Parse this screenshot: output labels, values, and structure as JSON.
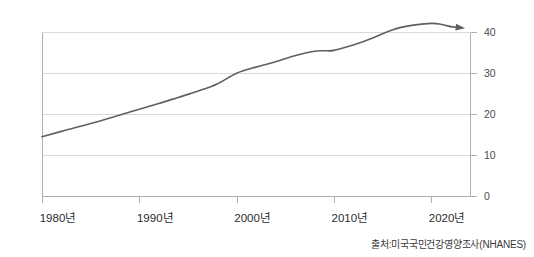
{
  "chart_data": {
    "type": "line",
    "title": "",
    "subtitle": "",
    "xlabel": "",
    "ylabel": "",
    "xlim": [
      1980,
      2024
    ],
    "ylim": [
      0,
      44
    ],
    "grid": true,
    "legend": false,
    "legend_position": "none",
    "x_tick_labels": [
      "1980년",
      "1990년",
      "2000년",
      "2010년",
      "2020년"
    ],
    "x_tick_values": [
      1980,
      1990,
      2000,
      2010,
      2020
    ],
    "y_tick_labels": [
      "0",
      "10",
      "20",
      "30",
      "40"
    ],
    "y_tick_values": [
      0,
      10,
      20,
      30,
      40
    ],
    "series": [
      {
        "name": "",
        "x": [
          1980,
          1982,
          1985,
          1988,
          1990,
          1992,
          1994,
          1996,
          1998,
          2000,
          2002,
          2004,
          2006,
          2008,
          2009,
          2010,
          2012,
          2014,
          2016,
          2018,
          2020,
          2021,
          2022
        ],
        "values": [
          14.5,
          15.8,
          17.7,
          19.8,
          21.2,
          22.6,
          24.1,
          25.6,
          27.4,
          30.0,
          31.5,
          32.8,
          34.3,
          35.4,
          35.5,
          35.6,
          36.9,
          38.6,
          40.6,
          41.7,
          42.2,
          42.0,
          41.4
        ]
      }
    ],
    "annotations": [
      {
        "type": "arrow",
        "name": "trend-arrow-end",
        "x": 2023.5,
        "y": 41.0,
        "direction": "right-down"
      }
    ]
  },
  "source": {
    "label": "출처:미국국민건강영양조사(NHANES)"
  },
  "colors": {
    "line": "#606060",
    "grid": "#d9d9d9",
    "axis": "#b0b0b0",
    "text": "#2b2b2b",
    "background": "#ffffff"
  }
}
